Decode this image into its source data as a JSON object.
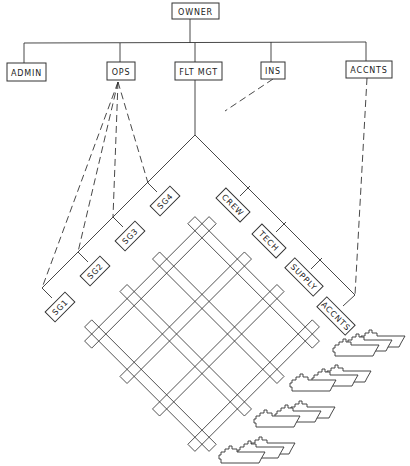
{
  "diagram": {
    "type": "organization-chart",
    "root": {
      "id": "owner",
      "label": "OWNER"
    },
    "departments": [
      {
        "id": "admin",
        "label": "ADMIN"
      },
      {
        "id": "ops",
        "label": "OPS"
      },
      {
        "id": "flt_mgt",
        "label": "FLT MGT"
      },
      {
        "id": "ins",
        "label": "INS"
      },
      {
        "id": "accnts",
        "label": "ACCNTS"
      }
    ],
    "ship_groups": [
      {
        "id": "sg1",
        "label": "SG1"
      },
      {
        "id": "sg2",
        "label": "SG2"
      },
      {
        "id": "sg3",
        "label": "SG3"
      },
      {
        "id": "sg4",
        "label": "SG4"
      }
    ],
    "functions": [
      {
        "id": "crew",
        "label": "CREW"
      },
      {
        "id": "tech",
        "label": "TECH"
      },
      {
        "id": "supply",
        "label": "SUPPLY"
      },
      {
        "id": "accnts_fn",
        "label": "ACCNTS"
      }
    ],
    "relationships": [
      {
        "from": "owner",
        "to": "admin",
        "style": "solid"
      },
      {
        "from": "owner",
        "to": "ops",
        "style": "solid"
      },
      {
        "from": "owner",
        "to": "flt_mgt",
        "style": "solid"
      },
      {
        "from": "owner",
        "to": "ins",
        "style": "solid"
      },
      {
        "from": "owner",
        "to": "accnts",
        "style": "solid"
      },
      {
        "from": "ops",
        "to": "sg1",
        "style": "dashed"
      },
      {
        "from": "ops",
        "to": "sg2",
        "style": "dashed"
      },
      {
        "from": "ops",
        "to": "sg3",
        "style": "dashed"
      },
      {
        "from": "ops",
        "to": "sg4",
        "style": "dashed"
      },
      {
        "from": "ins",
        "to": "flt_mgt_matrix",
        "style": "dashed"
      },
      {
        "from": "accnts",
        "to": "accnts_fn",
        "style": "dashed"
      }
    ],
    "matrix": {
      "rows": 4,
      "columns": 4
    },
    "fleet": {
      "groups": 4,
      "ships_per_group": 3
    }
  }
}
